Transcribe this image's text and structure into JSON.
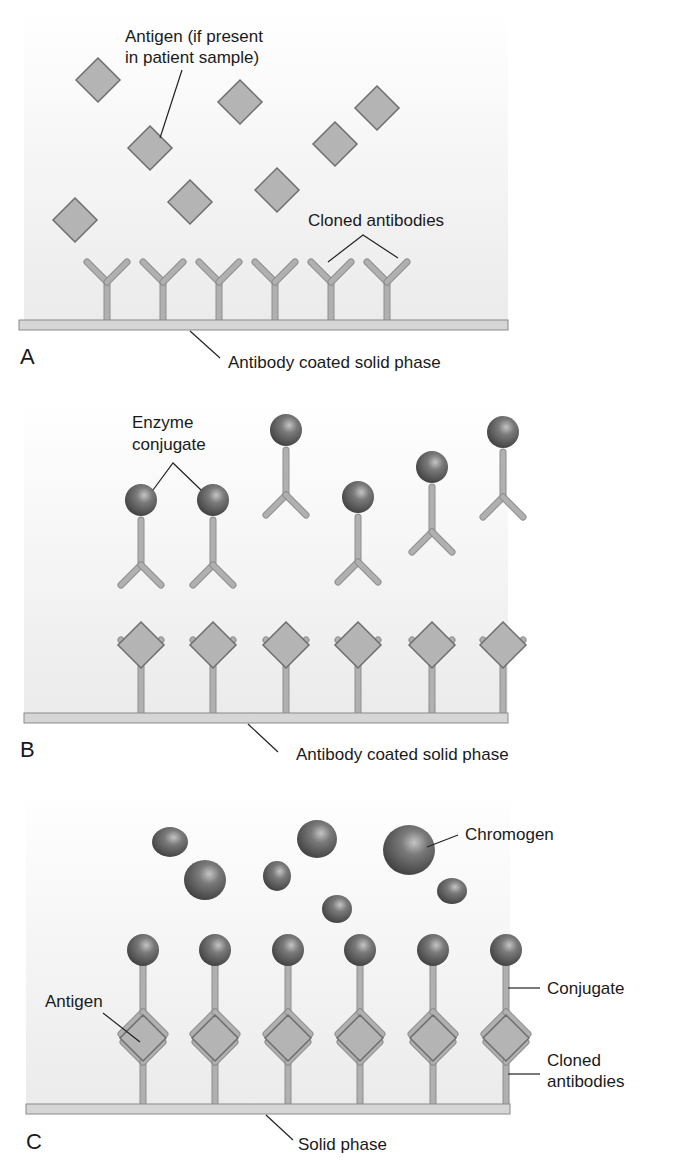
{
  "colors": {
    "panel_bg_top": "#ffffff",
    "panel_bg_bottom": "#ececec",
    "antibody": "#b0b0b0",
    "antibody_edge": "#8e8e8e",
    "antigen_fill": "#b4b4b4",
    "antigen_edge": "#6e6e6e",
    "solid_phase": "#d6d6d6",
    "solid_phase_edge": "#8a8a8a",
    "sphere_dark": "#4a4a4a",
    "sphere_light": "#b8b8b8",
    "leader": "#222222"
  },
  "panel_a": {
    "letter": "A",
    "antigen_label_line1": "Antigen (if present",
    "antigen_label_line2": "in patient sample)",
    "antibodies_label": "Cloned antibodies",
    "solid_phase_label": "Antibody coated solid phase",
    "antigens": [
      [
        98,
        80
      ],
      [
        150,
        148
      ],
      [
        240,
        102
      ],
      [
        190,
        202
      ],
      [
        277,
        190
      ],
      [
        335,
        144
      ],
      [
        377,
        108
      ],
      [
        75,
        220
      ]
    ],
    "antibody_x": [
      107,
      163,
      219,
      275,
      331,
      387
    ]
  },
  "panel_b": {
    "letter": "B",
    "conjugate_label_line1": "Enzyme",
    "conjugate_label_line2": "conjugate",
    "solid_phase_label": "Antibody coated solid phase",
    "free_conjugates": [
      [
        141,
        500
      ],
      [
        213,
        500
      ],
      [
        286,
        430
      ],
      [
        358,
        497
      ],
      [
        432,
        467
      ],
      [
        503,
        432
      ]
    ],
    "bound_x": [
      141,
      213,
      286,
      358,
      432,
      503
    ]
  },
  "panel_c": {
    "letter": "C",
    "chromogen_label": "Chromogen",
    "antigen_label": "Antigen",
    "conjugate_label": "Conjugate",
    "antibodies_label_line1": "Cloned",
    "antibodies_label_line2": "antibodies",
    "solid_phase_label": "Solid phase",
    "chromogens": [
      [
        170,
        842,
        18,
        15
      ],
      [
        205,
        880,
        21,
        20
      ],
      [
        277,
        876,
        14,
        15
      ],
      [
        317,
        839,
        20,
        19
      ],
      [
        337,
        909,
        15,
        14
      ],
      [
        409,
        850,
        26,
        25
      ],
      [
        452,
        891,
        15,
        13
      ]
    ],
    "complex_x": [
      143,
      215,
      288,
      360,
      433,
      506
    ]
  }
}
